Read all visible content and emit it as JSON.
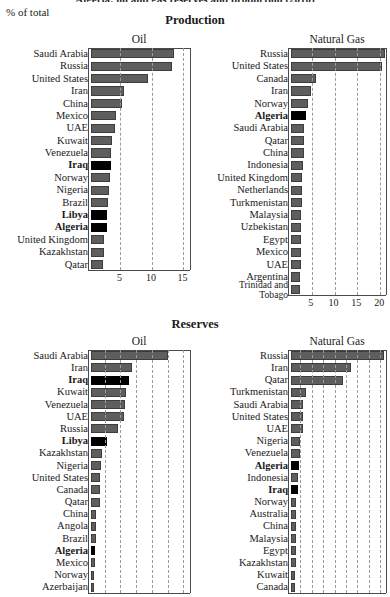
{
  "header": {
    "cut_title": "Algeria: oil and gas reserves and production (2010)",
    "unit_label": "% of total"
  },
  "sections": {
    "production": "Production",
    "reserves": "Reserves"
  },
  "panels": {
    "oil": "Oil",
    "gas": "Natural Gas"
  },
  "chart_data": [
    {
      "id": "oil-production",
      "type": "bar",
      "orientation": "horizontal",
      "title": "Oil",
      "section": "Production",
      "xlabel": "% of total",
      "ylabel": "",
      "xlim": [
        0,
        16.2
      ],
      "ticks": [
        5,
        10,
        15
      ],
      "grid": true,
      "legend": "none",
      "highlight_color": "#000000",
      "bar_color": "#5e5e5e",
      "categories": [
        "Saudi Arabia",
        "Russia",
        "United States",
        "Iran",
        "China",
        "Mexico",
        "UAE",
        "Kuwait",
        "Venezuela",
        "Iraq",
        "Norway",
        "Nigeria",
        "Brazil",
        "Libya",
        "Algeria",
        "United Kingdom",
        "Kazakhstan",
        "Qatar"
      ],
      "values": [
        13.2,
        12.9,
        9.1,
        5.3,
        4.9,
        4.0,
        3.8,
        3.4,
        3.2,
        3.2,
        3.0,
        2.8,
        2.7,
        2.6,
        2.5,
        2.1,
        2.1,
        1.9
      ],
      "highlighted": [
        "Iraq",
        "Libya",
        "Algeria"
      ]
    },
    {
      "id": "gas-production",
      "type": "bar",
      "orientation": "horizontal",
      "title": "Natural Gas",
      "section": "Production",
      "xlabel": "% of total",
      "ylabel": "",
      "xlim": [
        0,
        21.5
      ],
      "ticks": [
        5,
        10,
        15,
        20
      ],
      "grid": true,
      "legend": "none",
      "highlight_color": "#000000",
      "bar_color": "#5e5e5e",
      "categories": [
        "Russia",
        "United States",
        "Canada",
        "Iran",
        "Norway",
        "Algeria",
        "Saudi Arabia",
        "Qatar",
        "China",
        "Indonesia",
        "United Kingdom",
        "Netherlands",
        "Turkmenistan",
        "Malaysia",
        "Uzbekistan",
        "Egypt",
        "Mexico",
        "UAE",
        "Argentina",
        "Trinidad and Tobago"
      ],
      "values": [
        20.6,
        20.0,
        5.4,
        4.3,
        3.7,
        3.4,
        2.9,
        2.8,
        2.8,
        2.7,
        2.5,
        2.5,
        2.4,
        2.3,
        2.3,
        2.2,
        2.2,
        2.1,
        1.9,
        1.9
      ],
      "highlighted": [
        "Algeria"
      ]
    },
    {
      "id": "oil-reserves",
      "type": "bar",
      "orientation": "horizontal",
      "title": "Oil",
      "section": "Reserves",
      "xlabel": "% of total",
      "ylabel": "",
      "xlim": [
        0,
        16.2
      ],
      "ticks": [],
      "grid": true,
      "legend": "none",
      "highlight_color": "#000000",
      "bar_color": "#5e5e5e",
      "categories": [
        "Saudi Arabia",
        "Iran",
        "Iraq",
        "Kuwait",
        "Venezuela",
        "UAE",
        "Russia",
        "Libya",
        "Kazakhstan",
        "Nigeria",
        "United States",
        "Canada",
        "Qatar",
        "China",
        "Angola",
        "Brazil",
        "Algeria",
        "Mexico",
        "Norway",
        "Azerbaijan"
      ],
      "values": [
        12.3,
        6.5,
        6.1,
        5.6,
        5.4,
        5.2,
        4.3,
        2.6,
        1.7,
        1.6,
        1.5,
        1.4,
        1.4,
        0.8,
        0.8,
        0.8,
        0.7,
        0.7,
        0.5,
        0.5
      ],
      "highlighted": [
        "Iraq",
        "Libya",
        "Algeria"
      ]
    },
    {
      "id": "gas-reserves",
      "type": "bar",
      "orientation": "horizontal",
      "title": "Natural Gas",
      "section": "Reserves",
      "xlabel": "% of total",
      "ylabel": "",
      "xlim": [
        0,
        21.5
      ],
      "ticks": [],
      "grid": true,
      "legend": "none",
      "highlight_color": "#000000",
      "bar_color": "#5e5e5e",
      "categories": [
        "Russia",
        "Iran",
        "Qatar",
        "Turkmenistan",
        "Saudi Arabia",
        "United States",
        "UAE",
        "Nigeria",
        "Venezuela",
        "Algeria",
        "Indonesia",
        "Iraq",
        "Norway",
        "Australia",
        "China",
        "Malaysia",
        "Egypt",
        "Kazakhstan",
        "Kuwait",
        "Canada"
      ],
      "values": [
        20.5,
        13.2,
        11.5,
        3.3,
        2.7,
        2.6,
        2.6,
        2.0,
        1.9,
        1.7,
        1.5,
        1.5,
        1.2,
        1.2,
        1.2,
        1.1,
        1.1,
        1.0,
        0.9,
        0.9
      ],
      "highlighted": [
        "Algeria",
        "Iraq"
      ]
    }
  ]
}
